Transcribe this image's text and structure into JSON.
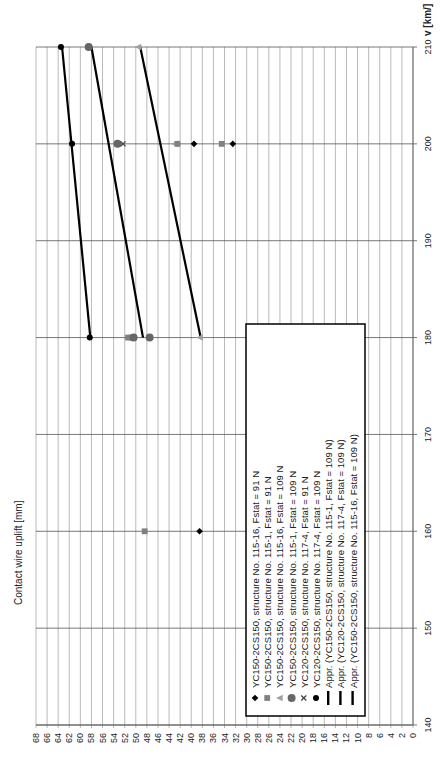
{
  "chart_data": {
    "type": "scatter",
    "orientation": "rotated-90-ccw",
    "title": "",
    "xlabel": "v [km/]",
    "ylabel": "Contact wire uplift [mm]",
    "xlim": [
      140,
      210
    ],
    "ylim": [
      0,
      68
    ],
    "x_ticks": [
      140,
      150,
      160,
      170,
      180,
      190,
      200,
      210
    ],
    "y_ticks": [
      0,
      2,
      4,
      6,
      8,
      10,
      12,
      14,
      16,
      18,
      20,
      22,
      24,
      26,
      28,
      30,
      32,
      34,
      36,
      38,
      40,
      42,
      44,
      46,
      48,
      50,
      52,
      54,
      56,
      58,
      60,
      62,
      64,
      66,
      68
    ],
    "grid": true,
    "legend_position": "inside-lower-left (rotated)",
    "series": [
      {
        "name": "YC150-2CS150, structure No. 115-16, Fstat = 91 N",
        "marker": "diamond",
        "color": "#000000",
        "x": [
          160,
          200
        ],
        "y": [
          38.5,
          32.5
        ]
      },
      {
        "name": "YC150-2CS150, structure No. 115-1, Fstat = 91 N",
        "marker": "square",
        "color": "#808080",
        "x": [
          160,
          180,
          200
        ],
        "y": [
          48.4,
          51.4,
          34.5
        ]
      },
      {
        "name": "YC150-2CS150, structure No. 115-16, Fstat = 109 N",
        "marker": "triangle",
        "color": "#a0a0a0",
        "x": [
          180,
          200,
          210
        ],
        "y": [
          38.5,
          43.0,
          49.6
        ]
      },
      {
        "name": "YC150-2CS150, structure No. 115-1, Fstat = 109 N",
        "marker": "circle",
        "color": "#666666",
        "x": [
          180,
          200,
          210
        ],
        "y": [
          47.5,
          53.3,
          58.5
        ]
      },
      {
        "name": "YC120-2CS150, structure No. 117-4, Fstat = 91 N",
        "marker": "x",
        "color": "#444444",
        "x": [
          180,
          200
        ],
        "y": [
          50.4,
          52.3
        ]
      },
      {
        "name": "YC120-2CS150, structure No. 117-4, Fstat = 109 N",
        "marker": "dot",
        "color": "#000000",
        "x": [
          180,
          200,
          210
        ],
        "y": [
          58.3,
          61.5,
          63.5
        ]
      },
      {
        "name": "Appr. (YC150-2CS150, structure No. 115-1, Fstat = 109 N)",
        "marker": "line",
        "color": "#000000",
        "x": [
          180,
          210
        ],
        "y": [
          48.7,
          58.0
        ]
      },
      {
        "name": "Appr. (YC120-2CS150, structure No. 117-4, Fstat = 109 N)",
        "marker": "line",
        "color": "#000000",
        "x": [
          180,
          210
        ],
        "y": [
          58.2,
          63.3
        ]
      },
      {
        "name": "Appr. (YC150-2CS150, structure No. 115-16, Fstat = 109 N)",
        "marker": "line",
        "color": "#000000",
        "x": [
          180,
          210
        ],
        "y": [
          38.3,
          49.2
        ]
      }
    ],
    "extra_points": [
      {
        "series": 1,
        "x": 180,
        "y": 50.8,
        "marker": "square"
      },
      {
        "series": 3,
        "x": 180,
        "y": 50.4,
        "marker": "circle"
      },
      {
        "series": 1,
        "x": 200,
        "y": 42.5,
        "marker": "square"
      },
      {
        "series": 0,
        "x": 200,
        "y": 39.5,
        "marker": "diamond"
      }
    ]
  },
  "legend": {
    "items": [
      "YC150-2CS150, structure No. 115-16, Fstat = 91 N",
      "YC150-2CS150, structure No. 115-1, Fstat = 91 N",
      "YC150-2CS150, structure No. 115-16, Fstat = 109 N",
      "YC150-2CS150, structure No. 115-1, Fstat = 109 N",
      "YC120-2CS150, structure No. 117-4, Fstat = 91 N",
      "YC120-2CS150, structure No. 117-4, Fstat = 109 N",
      "Appr. (YC150-2CS150, structure No. 115-1, Fstat = 109 N)",
      "Appr. (YC120-2CS150, structure No. 117-4, Fstat = 109 N)",
      "Appr. (YC150-2CS150, structure No. 115-16, Fstat = 109 N)"
    ]
  },
  "colors": {
    "grid": "#a8a8a8",
    "grid_major": "#555555",
    "text": "#222222"
  }
}
